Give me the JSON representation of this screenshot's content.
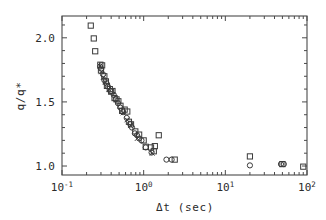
{
  "chart_data": {
    "type": "scatter",
    "title": "",
    "xlabel": "Δt  (sec)",
    "ylabel": "q/q*",
    "xscale": "log",
    "yscale": "linear",
    "xlim": [
      0.1,
      100
    ],
    "ylim": [
      0.93,
      2.17
    ],
    "grid": false,
    "legend": "none",
    "xticks": [
      {
        "value": 0.1,
        "label": "10",
        "exp": "-1"
      },
      {
        "value": 1,
        "label": "10",
        "exp": "0"
      },
      {
        "value": 10,
        "label": "10",
        "exp": "1"
      },
      {
        "value": 100,
        "label": "10",
        "exp": "2"
      }
    ],
    "yticks": [
      {
        "value": 2.0,
        "label": "2.0"
      },
      {
        "value": 1.5,
        "label": "1.5"
      },
      {
        "value": 1.0,
        "label": "1.0"
      }
    ],
    "yminor": [
      1.1,
      1.2,
      1.3,
      1.4,
      1.6,
      1.7,
      1.8,
      1.9,
      2.1
    ],
    "series": [
      {
        "name": "squares",
        "marker": "square",
        "points": [
          [
            0.225,
            2.095
          ],
          [
            0.245,
            1.995
          ],
          [
            0.255,
            1.895
          ],
          [
            0.295,
            1.79
          ],
          [
            0.31,
            1.785
          ],
          [
            0.3,
            1.745
          ],
          [
            0.33,
            1.7
          ],
          [
            0.345,
            1.66
          ],
          [
            0.355,
            1.625
          ],
          [
            0.385,
            1.6
          ],
          [
            0.4,
            1.58
          ],
          [
            0.415,
            1.585
          ],
          [
            0.44,
            1.53
          ],
          [
            0.465,
            1.52
          ],
          [
            0.49,
            1.505
          ],
          [
            0.52,
            1.47
          ],
          [
            0.545,
            1.43
          ],
          [
            0.585,
            1.44
          ],
          [
            0.63,
            1.425
          ],
          [
            0.66,
            1.345
          ],
          [
            0.7,
            1.325
          ],
          [
            0.79,
            1.27
          ],
          [
            0.88,
            1.245
          ],
          [
            1.0,
            1.2
          ],
          [
            1.06,
            1.15
          ],
          [
            1.23,
            1.145
          ],
          [
            1.33,
            1.115
          ],
          [
            1.37,
            1.155
          ],
          [
            1.53,
            1.24
          ],
          [
            2.4,
            1.05
          ],
          [
            20.0,
            1.075
          ],
          [
            50.0,
            1.015
          ],
          [
            90.0,
            0.995
          ]
        ]
      },
      {
        "name": "circles",
        "marker": "circle",
        "points": [
          [
            0.293,
            1.775
          ],
          [
            0.3,
            1.76
          ],
          [
            0.318,
            1.715
          ],
          [
            0.33,
            1.67
          ],
          [
            0.35,
            1.645
          ],
          [
            0.365,
            1.62
          ],
          [
            0.395,
            1.585
          ],
          [
            0.43,
            1.555
          ],
          [
            0.455,
            1.52
          ],
          [
            0.485,
            1.49
          ],
          [
            0.52,
            1.455
          ],
          [
            0.56,
            1.42
          ],
          [
            0.62,
            1.375
          ],
          [
            0.68,
            1.33
          ],
          [
            0.72,
            1.3
          ],
          [
            0.78,
            1.255
          ],
          [
            0.83,
            1.24
          ],
          [
            0.88,
            1.215
          ],
          [
            0.94,
            1.2
          ],
          [
            1.06,
            1.145
          ],
          [
            1.25,
            1.105
          ],
          [
            1.9,
            1.05
          ],
          [
            2.2,
            1.05
          ],
          [
            20.0,
            1.005
          ],
          [
            48.0,
            1.015
          ],
          [
            52.0,
            1.015
          ]
        ]
      },
      {
        "name": "crosses",
        "marker": "x",
        "points": [
          [
            0.292,
            1.78
          ],
          [
            0.305,
            1.735
          ],
          [
            0.32,
            1.69
          ],
          [
            0.34,
            1.655
          ],
          [
            0.375,
            1.6
          ],
          [
            0.56,
            1.415
          ],
          [
            0.625,
            1.36
          ],
          [
            0.69,
            1.315
          ],
          [
            0.835,
            1.215
          ],
          [
            1.27,
            1.1
          ]
        ]
      }
    ]
  },
  "axes_geometry": {
    "left": 62,
    "right": 307,
    "top": 16,
    "bottom": 175
  }
}
